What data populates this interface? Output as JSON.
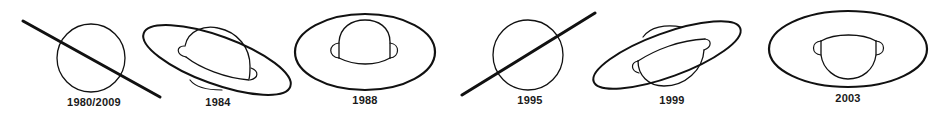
{
  "diagram": {
    "ink_color": "#111111",
    "background": "#ffffff",
    "panels": [
      {
        "label": "1980/2009",
        "view": "rings edge-on",
        "tilt_direction": "down-right"
      },
      {
        "label": "1984",
        "view": "rings tilted, north face",
        "tilt_direction": "down-right"
      },
      {
        "label": "1988",
        "view": "rings open, north face",
        "tilt_direction": "level"
      },
      {
        "label": "1995",
        "view": "rings edge-on",
        "tilt_direction": "up-right"
      },
      {
        "label": "1999",
        "view": "rings tilted, south face",
        "tilt_direction": "up-right"
      },
      {
        "label": "2003",
        "view": "rings open, south face",
        "tilt_direction": "level"
      }
    ]
  }
}
